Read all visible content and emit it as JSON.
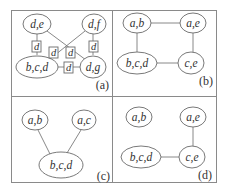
{
  "figure": {
    "panels": [
      {
        "id": "a",
        "label": "(a)",
        "nodes": [
          {
            "id": "de",
            "label": "d,e"
          },
          {
            "id": "df",
            "label": "d,f"
          },
          {
            "id": "bcd",
            "label": "b,c,d"
          },
          {
            "id": "dg",
            "label": "d,g"
          }
        ],
        "separators": [
          {
            "between": [
              "d,e",
              "b,c,d"
            ],
            "label": "d"
          },
          {
            "between": [
              "d,f",
              "b,c,d"
            ],
            "label": "d"
          },
          {
            "between": [
              "d,e",
              "d,g"
            ],
            "label": "d"
          },
          {
            "between": [
              "d,f",
              "d,g"
            ],
            "label": "d"
          },
          {
            "between": [
              "b,c,d",
              "d,g"
            ],
            "label": "d"
          }
        ]
      },
      {
        "id": "b",
        "label": "(b)",
        "nodes": [
          {
            "id": "ab",
            "label": "a,b"
          },
          {
            "id": "ae",
            "label": "a,e"
          },
          {
            "id": "bcd",
            "label": "b,c,d"
          },
          {
            "id": "ce",
            "label": "c,e"
          }
        ],
        "edges": [
          [
            "a,b",
            "a,e"
          ],
          [
            "a,b",
            "b,c,d"
          ],
          [
            "a,e",
            "c,e"
          ],
          [
            "b,c,d",
            "c,e"
          ]
        ]
      },
      {
        "id": "c",
        "label": "(c)",
        "nodes": [
          {
            "id": "ab",
            "label": "a,b"
          },
          {
            "id": "ac",
            "label": "a,c"
          },
          {
            "id": "bcd",
            "label": "b,c,d"
          }
        ],
        "edges": [
          [
            "a,b",
            "b,c,d"
          ],
          [
            "a,c",
            "b,c,d"
          ]
        ]
      },
      {
        "id": "d",
        "label": "(d)",
        "nodes": [
          {
            "id": "ab",
            "label": "a,b"
          },
          {
            "id": "ae",
            "label": "a,e"
          },
          {
            "id": "bcd",
            "label": "b,c,d"
          },
          {
            "id": "ce",
            "label": "c,e"
          }
        ],
        "edges": [
          [
            "a,e",
            "c,e"
          ],
          [
            "b,c,d",
            "c,e"
          ]
        ]
      }
    ]
  }
}
